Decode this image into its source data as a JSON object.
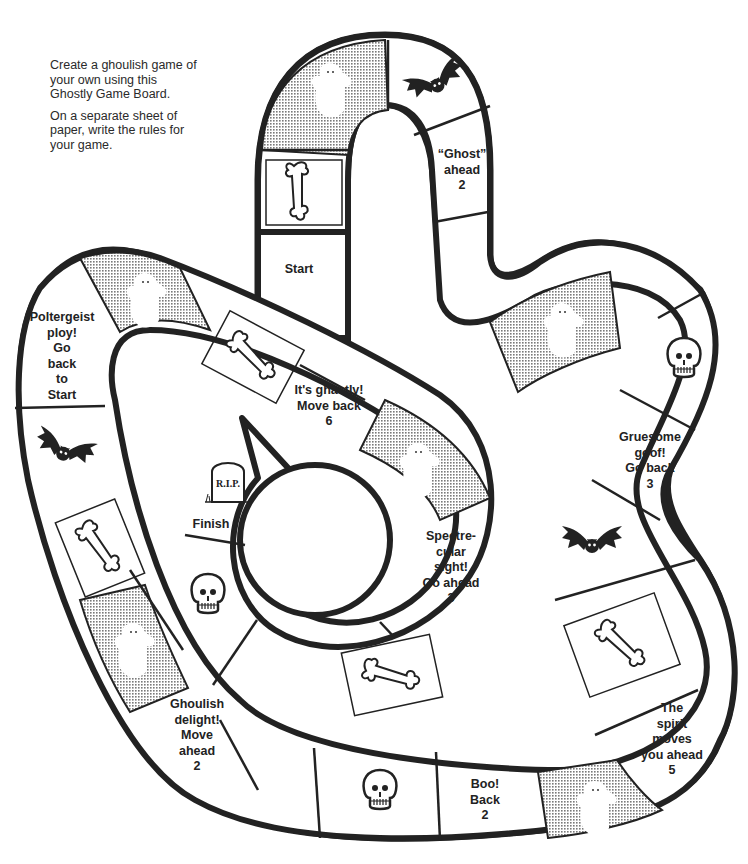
{
  "intro": {
    "paragraph1": "Create a ghoulish game of your own using this Ghostly Game Board.",
    "paragraph2": "On a separate sheet of paper, write the rules for your game."
  },
  "colors": {
    "outline": "#222222",
    "paper": "#ffffff",
    "stipple": "#8c8c8c"
  },
  "spaces": [
    {
      "id": "start",
      "icon": "none",
      "lines": [
        "Start"
      ]
    },
    {
      "id": "s2",
      "icon": "bones-icon",
      "lines": []
    },
    {
      "id": "s3",
      "icon": "ghost-icon",
      "lines": []
    },
    {
      "id": "s4",
      "icon": "bat-icon",
      "lines": []
    },
    {
      "id": "s5",
      "icon": "none",
      "lines": [
        "“Ghost”",
        "ahead",
        "2"
      ]
    },
    {
      "id": "s6",
      "icon": "none",
      "lines": []
    },
    {
      "id": "s7",
      "icon": "ghost-icon",
      "lines": []
    },
    {
      "id": "s8",
      "icon": "none",
      "lines": []
    },
    {
      "id": "s9",
      "icon": "skull-icon",
      "lines": []
    },
    {
      "id": "s10",
      "icon": "none",
      "lines": [
        "Gruesome",
        "goof!",
        "Go back",
        "3"
      ]
    },
    {
      "id": "s11",
      "icon": "bat-icon",
      "lines": []
    },
    {
      "id": "s12",
      "icon": "bones-icon",
      "lines": []
    },
    {
      "id": "s13",
      "icon": "none",
      "lines": [
        "The",
        "spirit",
        "moves",
        "you ahead",
        "5"
      ]
    },
    {
      "id": "s14",
      "icon": "ghost-icon",
      "lines": []
    },
    {
      "id": "s15",
      "icon": "none",
      "lines": [
        "Boo!",
        "Back",
        "2"
      ]
    },
    {
      "id": "s16",
      "icon": "skull-icon",
      "lines": []
    },
    {
      "id": "s17",
      "icon": "none",
      "lines": []
    },
    {
      "id": "s18",
      "icon": "none",
      "lines": [
        "Ghoulish",
        "delight!",
        "Move",
        "ahead",
        "2"
      ]
    },
    {
      "id": "s19",
      "icon": "ghost-icon",
      "lines": []
    },
    {
      "id": "s20",
      "icon": "bones-icon",
      "lines": []
    },
    {
      "id": "s21",
      "icon": "bat-icon",
      "lines": []
    },
    {
      "id": "s22",
      "icon": "none",
      "lines": [
        "Poltergeist",
        "ploy!",
        "Go",
        "back",
        "to",
        "Start"
      ]
    },
    {
      "id": "s23",
      "icon": "ghost-icon",
      "lines": []
    },
    {
      "id": "s24",
      "icon": "bones-icon",
      "lines": []
    },
    {
      "id": "s25",
      "icon": "none",
      "lines": [
        "It's ghastly!",
        "Move back",
        "6"
      ]
    },
    {
      "id": "s26",
      "icon": "ghost-icon",
      "lines": []
    },
    {
      "id": "s27",
      "icon": "none",
      "lines": [
        "Spectre-",
        "cular",
        "sight!",
        "Go ahead",
        "3"
      ]
    },
    {
      "id": "s28",
      "icon": "bones-icon",
      "lines": []
    },
    {
      "id": "s29",
      "icon": "none",
      "lines": []
    },
    {
      "id": "s30",
      "icon": "skull-icon",
      "lines": []
    },
    {
      "id": "finish",
      "icon": "tombstone-icon",
      "tombstone_text": "R.I.P.",
      "lines": [
        "Finish"
      ]
    }
  ]
}
